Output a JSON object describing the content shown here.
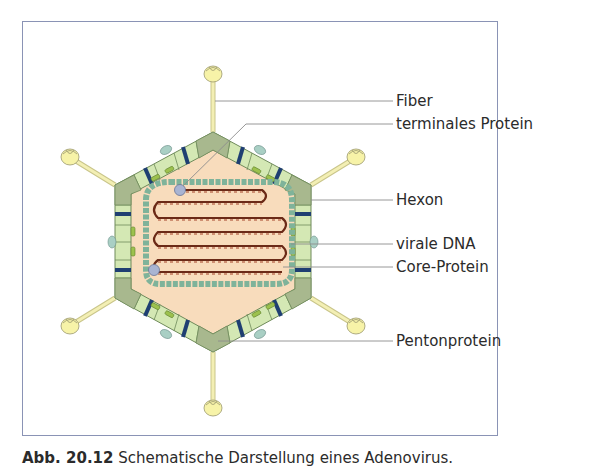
{
  "figure": {
    "labels": [
      {
        "id": "fiber",
        "text": "Fiber",
        "y": 93
      },
      {
        "id": "terminal-protein",
        "text": "terminales Protein",
        "y": 116
      },
      {
        "id": "hexon",
        "text": "Hexon",
        "y": 192
      },
      {
        "id": "viral-dna",
        "text": "virale DNA",
        "y": 236
      },
      {
        "id": "core-protein",
        "text": "Core-Protein",
        "y": 259
      },
      {
        "id": "penton-protein",
        "text": "Pentonprotein",
        "y": 333
      }
    ],
    "colors": {
      "frame_border": "#8a93b5",
      "capsid_interior": "#f8dcbc",
      "hexon_fill": "#d4e8b4",
      "penton_fill": "#a8b88e",
      "band_dark_blue": "#1f3f72",
      "minor_protein_green": "#9cc14e",
      "knob_yellow": "#f7f3a8",
      "fiber_shaft": "#f3efb4",
      "core_protein_bead": "#7fb39a",
      "dna_strand": "#6b2a17",
      "terminal_protein": "#a9b4d2",
      "leader_line": "#8c8c8c"
    }
  },
  "caption": {
    "prefix": "Abb. 20.12",
    "text": "Schematische Darstellung eines Adenovirus."
  }
}
